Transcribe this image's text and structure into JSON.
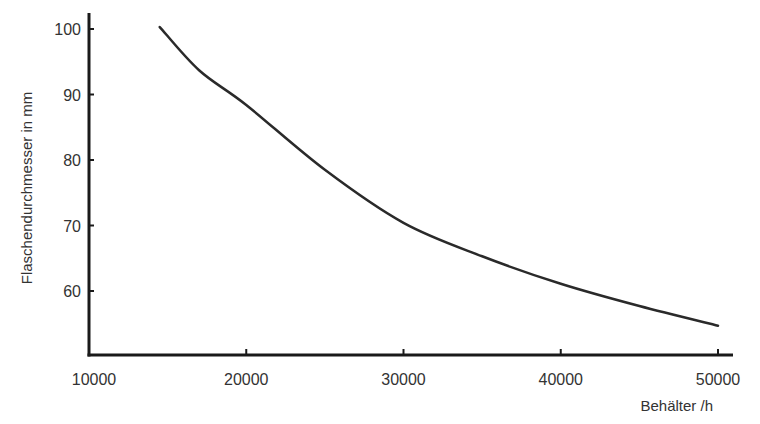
{
  "chart_data": {
    "type": "line",
    "title": "",
    "xlabel": "Behälter /h",
    "ylabel": "Flaschendurchmesser in mm",
    "xlim": [
      10000,
      50000
    ],
    "ylim": [
      50,
      102
    ],
    "xticks": [
      10000,
      20000,
      30000,
      40000,
      50000
    ],
    "yticks": [
      60,
      70,
      80,
      90,
      100
    ],
    "xtick_labels": [
      "10000",
      "20000",
      "30000",
      "40000",
      "50000"
    ],
    "ytick_labels": [
      "60",
      "70",
      "80",
      "90",
      "100"
    ],
    "grid": false,
    "legend": "none",
    "series": [
      {
        "name": "Flaschendurchmesser",
        "color": "#2a2a2a",
        "x": [
          14500,
          17000,
          20000,
          25000,
          30000,
          35000,
          40000,
          45000,
          50000
        ],
        "y": [
          100.3,
          93.7,
          88.4,
          78.5,
          70.4,
          65.3,
          61.1,
          57.7,
          54.7
        ]
      }
    ]
  }
}
